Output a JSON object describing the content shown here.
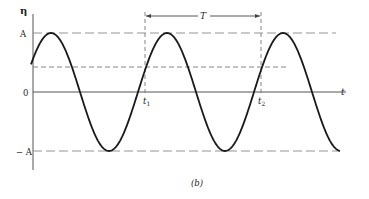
{
  "figure": {
    "caption": "(b)",
    "y_axis_label": "η",
    "x_axis_label": "t",
    "levels": {
      "amplitude_pos": "A",
      "zero": "0",
      "amplitude_neg": "− A"
    },
    "markers": {
      "t1": {
        "base": "t",
        "sub": "1"
      },
      "t2": {
        "base": "t",
        "sub": "2"
      },
      "period": "T"
    },
    "colors": {
      "curve": "#1a1a1a",
      "axis": "#555555",
      "dashed": "#777777"
    }
  },
  "chart_data": {
    "type": "line",
    "title": "",
    "xlabel": "t",
    "ylabel": "η",
    "amplitude": "A",
    "period_label": "T",
    "annotations": [
      "A",
      "0",
      "-A",
      "t1",
      "t2",
      "T"
    ]
  }
}
